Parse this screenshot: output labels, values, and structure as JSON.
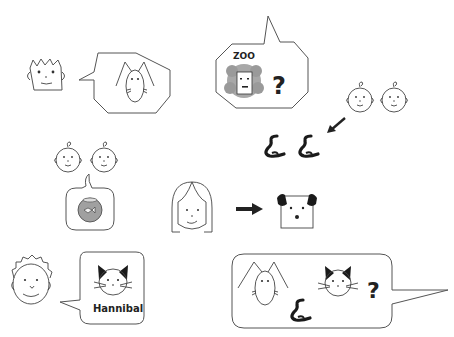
{
  "scene": {
    "background": "#ffffff",
    "line_color": "#555555",
    "fill_dark": "#1a1a1a",
    "fill_gray": "#9a9a9a"
  },
  "panels": {
    "spiky_boy_rabbit": {
      "speaker": "spiky-haired-boy",
      "bubble_shape": "octagon",
      "bubble_content": [
        "rabbit"
      ]
    },
    "zoo_question": {
      "bubble_shape": "octagon",
      "zoo_label": "ZOO",
      "bubble_content": [
        "lion",
        "question-mark"
      ],
      "question_mark": "?"
    },
    "twins_snakes": {
      "people": [
        "baby",
        "baby"
      ],
      "arrow_direction": "down-left",
      "objects": [
        "snake",
        "snake"
      ]
    },
    "twins_fish": {
      "people": [
        "baby",
        "baby"
      ],
      "bubble_shape": "rounded-rect",
      "bubble_content": [
        "fishbowl-with-fish"
      ]
    },
    "girl_dog": {
      "person": "girl",
      "arrow_direction": "right",
      "object": "dog"
    },
    "boy_cat": {
      "speaker": "curly-haired-boy",
      "bubble_shape": "rounded-rect",
      "bubble_content": [
        "cat"
      ],
      "cat_name": "Hannibal"
    },
    "pets_question": {
      "bubble_shape": "rounded-rect",
      "bubble_content": [
        "rabbit",
        "snake",
        "cat",
        "question-mark"
      ],
      "question_mark": "?"
    }
  }
}
